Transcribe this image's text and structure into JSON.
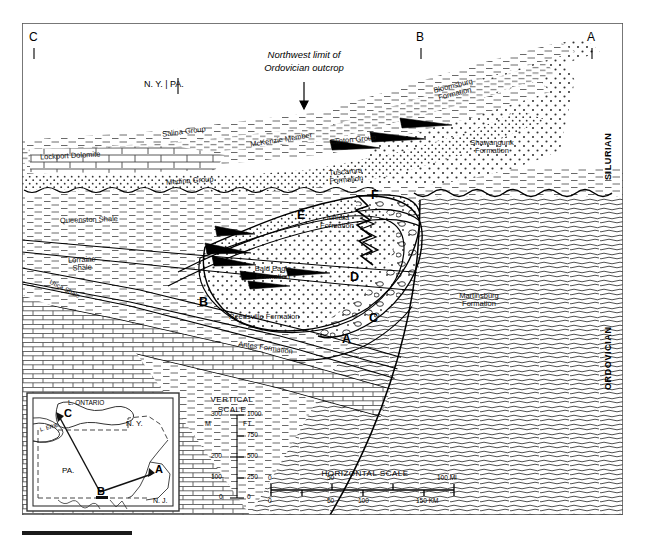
{
  "figure": {
    "type": "geologic-cross-section",
    "title": "",
    "frame": {
      "x": 22,
      "y": 23,
      "w": 601,
      "h": 492
    }
  },
  "top_ticks": [
    {
      "label": "C",
      "x": 29,
      "y": 31
    },
    {
      "label": "B",
      "x": 417,
      "y": 31
    },
    {
      "label": "A",
      "x": 588,
      "y": 31
    }
  ],
  "annotations": {
    "state_divider": "N. Y. | PA.",
    "northwest_limit_line1": "Northwest limit of",
    "northwest_limit_line2": "Ordovician outcrop"
  },
  "era_labels": [
    {
      "label": "SILURIAN",
      "x": 604,
      "y": 150
    },
    {
      "label": "ORDOVICIAN",
      "x": 604,
      "y": 355
    }
  ],
  "formations": [
    {
      "name": "Bloomsburg Formation",
      "lines": [
        "Bloomsburg",
        "Formation"
      ],
      "x": 453,
      "y": 86,
      "rot": -14
    },
    {
      "name": "Shawangunk Formation",
      "lines": [
        "Shawangunk",
        "Formation"
      ],
      "x": 490,
      "y": 143,
      "rot": 0
    },
    {
      "name": "Salina Group",
      "lines": [
        "Salina Group"
      ],
      "x": 182,
      "y": 131,
      "rot": -7
    },
    {
      "name": "McKenzie Member",
      "lines": [
        "McKenzie Member"
      ],
      "x": 285,
      "y": 139,
      "rot": -9
    },
    {
      "name": "Clinton Group",
      "lines": [
        "Clinton Group"
      ],
      "x": 353,
      "y": 140,
      "rot": -6
    },
    {
      "name": "Lockport Dolomite",
      "lines": [
        "Lockport Dolomite"
      ],
      "x": 47,
      "y": 155,
      "rot": -3
    },
    {
      "name": "Medina Group",
      "lines": [
        "Medina Group"
      ],
      "x": 186,
      "y": 181,
      "rot": -4
    },
    {
      "name": "Tuscarora Formation",
      "lines": [
        "Tuscarora",
        "Formation"
      ],
      "x": 343,
      "y": 171,
      "rot": -5
    },
    {
      "name": "Queenston Shale",
      "lines": [
        "Queenston Shale"
      ],
      "x": 68,
      "y": 219,
      "rot": -2
    },
    {
      "name": "Juniata Formation",
      "lines": [
        "Juniata",
        "Formation"
      ],
      "x": 334,
      "y": 218,
      "rot": 0
    },
    {
      "name": "Lorraine Shale",
      "lines": [
        "Lorraine",
        "Shale"
      ],
      "x": 76,
      "y": 260,
      "rot": -3
    },
    {
      "name": "Utica Shale",
      "lines": [
        "Utica Shale"
      ],
      "x": 58,
      "y": 288,
      "rot": 28
    },
    {
      "name": "Bald Eagle Formation",
      "lines": [
        "Bald Eagle",
        "Formation"
      ],
      "x": 270,
      "y": 268,
      "rot": 0
    },
    {
      "name": "Martinsburg Formation",
      "lines": [
        "Martinsburg",
        "Formation"
      ],
      "x": 476,
      "y": 295,
      "rot": 0
    },
    {
      "name": "Reedsville Formation",
      "lines": [
        "Reedsville Formation"
      ],
      "x": 260,
      "y": 316,
      "rot": 0
    },
    {
      "name": "Antes Formation",
      "lines": [
        "Antes Formation"
      ],
      "x": 270,
      "y": 346,
      "rot": 8
    }
  ],
  "section_letters": [
    {
      "label": "F",
      "x": 373,
      "y": 190
    },
    {
      "label": "E",
      "x": 299,
      "y": 210
    },
    {
      "label": "D",
      "x": 352,
      "y": 272
    },
    {
      "label": "C",
      "x": 371,
      "y": 313
    },
    {
      "label": "B",
      "x": 201,
      "y": 297
    },
    {
      "label": "A",
      "x": 344,
      "y": 334
    }
  ],
  "vertical_scale": {
    "title_line1": "VERTICAL",
    "title_line2": "SCALE",
    "unit_left": "M",
    "unit_right": "FT",
    "meters": [
      "300",
      "200",
      "100",
      "0"
    ],
    "feet": [
      "1000",
      "750",
      "500",
      "250",
      "0"
    ]
  },
  "horizontal_scale": {
    "title": "HORIZONTAL   SCALE",
    "miles": [
      "0",
      "50",
      "100 MI"
    ],
    "km": [
      "0",
      "50",
      "100",
      "150 KM"
    ]
  },
  "inset_map": {
    "lake_ontario": "L. ONTARIO",
    "lake_erie": "L. ERIE",
    "ny": "N. Y.",
    "pa": "PA.",
    "nj": "N. J.",
    "points": [
      {
        "label": "C",
        "x": 57,
        "y": 414
      },
      {
        "label": "B",
        "x": 101,
        "y": 496
      },
      {
        "label": "A",
        "x": 153,
        "y": 470
      }
    ]
  },
  "colors": {
    "ink": "#1a1a1a",
    "line": "#000000",
    "paper": "#ffffff",
    "shale_tint": "#f2f2f2",
    "sand_tint": "#fafafa"
  }
}
